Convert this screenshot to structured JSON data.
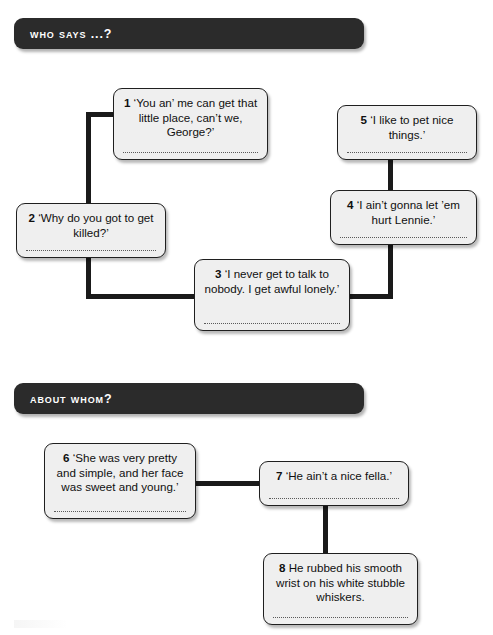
{
  "document": {
    "title": "Who says ...? / About whom?",
    "page_background": "#ffffff",
    "banner_color": "#2b2b2b",
    "box_fill": "#efefef",
    "box_border": "#1f1f1f",
    "connector_color": "#1a1a1a"
  },
  "sections": [
    {
      "id": "who-says",
      "heading": "Who says ...?",
      "boxes": [
        {
          "number": "1",
          "text": "‘You an’ me can get that little place, can’t we, George?’",
          "has_answer_line": true
        },
        {
          "number": "2",
          "text": "‘Why do you got to get killed?’",
          "has_answer_line": true
        },
        {
          "number": "3",
          "text": "‘I never get to talk to nobody. I get awful lonely.’",
          "has_answer_line": true
        },
        {
          "number": "4",
          "text": "‘I ain’t gonna let ’em hurt Lennie.’",
          "has_answer_line": true
        },
        {
          "number": "5",
          "text": "‘I like to pet nice things.’",
          "has_answer_line": true
        }
      ]
    },
    {
      "id": "about-whom",
      "heading": "About whom?",
      "boxes": [
        {
          "number": "6",
          "text": "‘She was very pretty and simple, and her face was sweet and young.’",
          "has_answer_line": true
        },
        {
          "number": "7",
          "text": "‘He ain’t a nice fella.’",
          "has_answer_line": true
        },
        {
          "number": "8",
          "text": "He rubbed his smooth wrist on his white stubble whiskers.",
          "has_answer_line": true
        }
      ]
    }
  ]
}
